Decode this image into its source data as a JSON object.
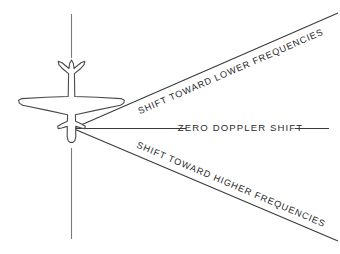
{
  "figure": {
    "background_color": "#ffffff",
    "line_color": "#3a3a3a",
    "text_color": "#2b2b2b",
    "width": 340,
    "height": 254
  },
  "labels": {
    "upper_ray": "SHIFT TOWARD LOWER FREQUENCIES",
    "center_ray": "ZERO DOPPLER SHIFT",
    "lower_ray": "SHIFT TOWARD HIGHER FREQUENCIES"
  },
  "subject": {
    "name": "aircraft-plan-view",
    "orientation": "nose-down",
    "flight_path_label": ""
  }
}
